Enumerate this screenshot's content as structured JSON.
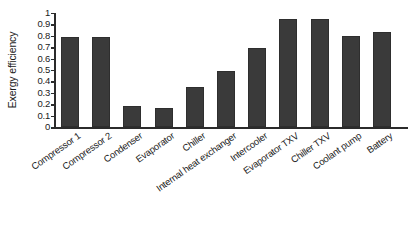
{
  "chart_data": {
    "type": "bar",
    "title": "",
    "xlabel": "",
    "ylabel": "Exergy efficiency",
    "ylim": [
      0,
      1
    ],
    "grid": false,
    "legend": false,
    "bar_color": "#3a3a3a",
    "axis_color": "#2b2b2b",
    "background": "#ffffff",
    "y_ticks": [
      "0",
      "0.1",
      "0.2",
      "0.3",
      "0.4",
      "0.5",
      "0.6",
      "0.7",
      "0.8",
      "0.9",
      "1"
    ],
    "y_tick_values": [
      0,
      0.1,
      0.2,
      0.3,
      0.4,
      0.5,
      0.6,
      0.7,
      0.8,
      0.9,
      1
    ],
    "x_label_rotation_deg": -35,
    "categories": [
      "Compressor 1",
      "Compressor 2",
      "Condenser",
      "Evaporator",
      "Chiller",
      "Internal heat exchanger",
      "Intercooler",
      "Evaporator TXV",
      "Chiller TXV",
      "Coolant pump",
      "Battery"
    ],
    "values": [
      0.79,
      0.79,
      0.18,
      0.17,
      0.35,
      0.49,
      0.69,
      0.95,
      0.95,
      0.8,
      0.83
    ]
  }
}
